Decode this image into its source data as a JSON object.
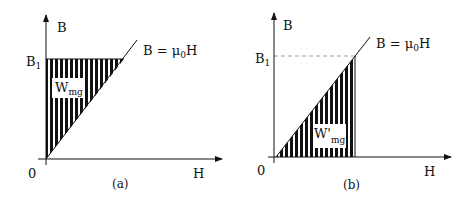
{
  "panels": [
    {
      "id": "a",
      "caption": "(a)",
      "y_axis_label": "B",
      "x_axis_label": "H",
      "origin_label": "0",
      "level_label": "B",
      "level_subscript": "1",
      "line_label_prefix": "B = μ",
      "line_label_subscript": "0",
      "line_label_suffix": "H",
      "region_label": "W",
      "region_subscript": "mg",
      "region_description": "Hatched area between B-axis and B = μ0H line, from 0 to B1"
    },
    {
      "id": "b",
      "caption": "(b)",
      "y_axis_label": "B",
      "x_axis_label": "H",
      "origin_label": "0",
      "level_label": "B",
      "level_subscript": "1",
      "line_label_prefix": "B = μ",
      "line_label_subscript": "0",
      "line_label_suffix": "H",
      "region_label": "W'",
      "region_subscript": "mg",
      "region_description": "Hatched area under B = μ0H line and above H-axis, up to B1"
    }
  ],
  "colors": {
    "ink": "#111111",
    "background": "#ffffff",
    "dashed": "#888888"
  }
}
